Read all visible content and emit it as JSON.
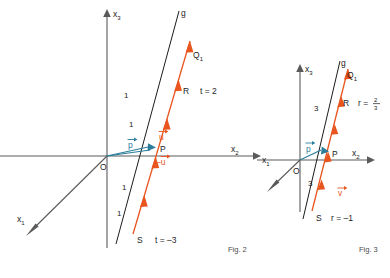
{
  "page": {
    "background": "#ffffff",
    "width": 390,
    "height": 278
  },
  "colors": {
    "axis": "#5a5a5a",
    "line_g": "#1c1c1c",
    "vector_orange": "#e8551f",
    "vector_blue": "#2a7d9b",
    "text": "#1c1c1c",
    "caption": "#4a4a4a"
  },
  "figures": [
    {
      "id": "fig2",
      "caption": "Fig. 2",
      "axes": {
        "x1": "x",
        "x1_sub": "1",
        "x2": "x",
        "x2_sub": "2",
        "x3": "x",
        "x3_sub": "3",
        "origin": "O"
      },
      "line_label": "g",
      "points": {
        "Q1": "Q",
        "Q1_sub": "1",
        "R": "R",
        "P": "P",
        "S": "S"
      },
      "parameters": {
        "R_param": "t = 2",
        "S_param": "t = –3"
      },
      "vectors": {
        "direction": "u",
        "direction_neg": "–u",
        "position": "p"
      },
      "ticks": [
        "1",
        "1",
        "1",
        "1"
      ]
    },
    {
      "id": "fig3",
      "caption": "Fig. 3",
      "axes": {
        "x1": "x",
        "x1_sub": "1",
        "x2": "x",
        "x2_sub": "2",
        "x3": "x",
        "x3_sub": "3",
        "origin": "O"
      },
      "line_label": "g",
      "points": {
        "Q1": "Q",
        "Q1_sub": "1",
        "R": "R",
        "P": "P",
        "S": "S"
      },
      "parameters": {
        "R_param_lead": "r =",
        "R_param_num": "2",
        "R_param_den": "3",
        "S_param": "r = –1"
      },
      "vectors": {
        "direction": "v",
        "position": "p"
      },
      "ticks": [
        "3",
        "3"
      ]
    }
  ]
}
